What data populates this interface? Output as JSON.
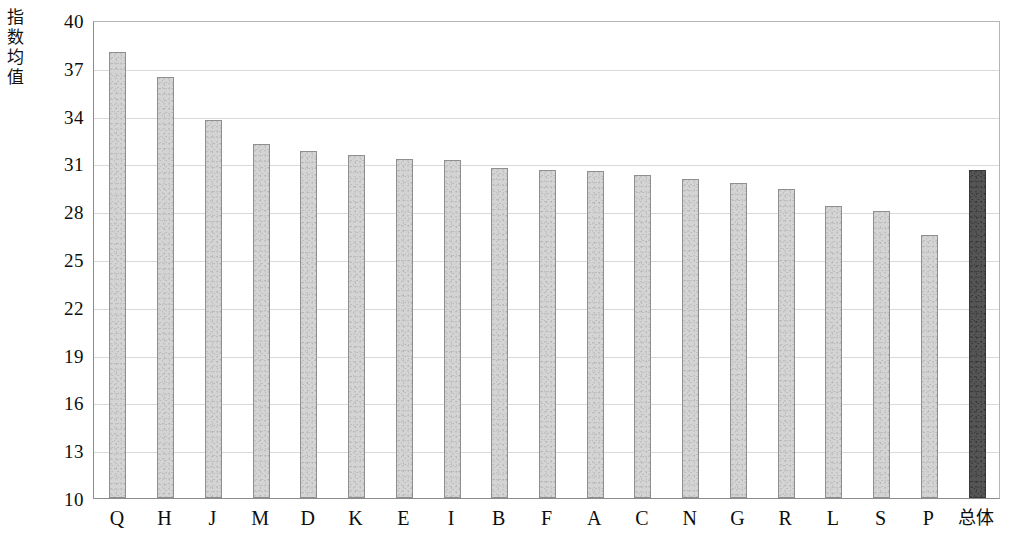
{
  "chart_data": {
    "type": "bar",
    "title": "",
    "xlabel": "",
    "ylabel": "指数均值",
    "ylim": [
      10,
      40
    ],
    "yticks": [
      40,
      37,
      34,
      31,
      28,
      25,
      22,
      19,
      16,
      13,
      10
    ],
    "grid": true,
    "legend": "none",
    "categories": [
      "Q",
      "H",
      "J",
      "M",
      "D",
      "K",
      "E",
      "I",
      "B",
      "F",
      "A",
      "C",
      "N",
      "G",
      "R",
      "L",
      "S",
      "P",
      "总体"
    ],
    "values": [
      38.0,
      36.4,
      33.7,
      32.2,
      31.8,
      31.5,
      31.3,
      31.2,
      30.7,
      30.6,
      30.5,
      30.3,
      30.0,
      29.8,
      29.4,
      28.3,
      28.0,
      26.5,
      30.6
    ],
    "series": [
      {
        "name": "指数均值",
        "values": [
          38.0,
          36.4,
          33.7,
          32.2,
          31.8,
          31.5,
          31.3,
          31.2,
          30.7,
          30.6,
          30.5,
          30.3,
          30.0,
          29.8,
          29.4,
          28.3,
          28.0,
          26.5,
          30.6
        ]
      }
    ],
    "highlight_category": "总体",
    "colors": {
      "bar_fill": "#d4d4d4",
      "bar_border": "#8f8f8f",
      "total_bar_fill": "#555555",
      "total_bar_border": "#3a3a3a",
      "gridline": "#d9d9d9",
      "axis": "#8c8c8c",
      "text": "#0d0d0d"
    }
  },
  "axis": {
    "y_title_chars": [
      "指",
      "数",
      "均",
      "值"
    ]
  }
}
